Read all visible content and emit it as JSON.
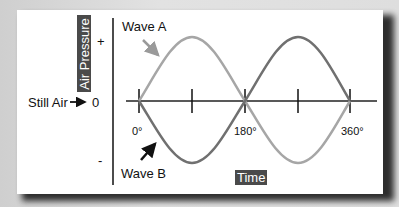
{
  "diagram": {
    "y_axis": {
      "title": "Air Pressure",
      "plus_label": "+",
      "zero_label": "0",
      "minus_label": "-",
      "still_air_label": "Still Air"
    },
    "x_axis": {
      "title": "Time",
      "tick_labels": [
        "0°",
        "180°",
        "360°"
      ],
      "ticks_degrees": [
        0,
        90,
        180,
        270,
        360
      ]
    },
    "waves": [
      {
        "name": "Wave A",
        "label": "Wave A",
        "phase": "starts positive",
        "color": "#a6a6a6"
      },
      {
        "name": "Wave B",
        "label": "Wave B",
        "phase": "starts negative (180° out of phase)",
        "color": "#6e6e6e"
      }
    ],
    "colors": {
      "background": "#d9d9d9",
      "card": "#ffffff",
      "axis": "#111111",
      "label_box": "#4a4a4a",
      "wave_a": "#a6a6a6",
      "wave_b": "#6e6e6e",
      "arrow_a": "#9a9a9a",
      "arrow_b": "#111111"
    }
  }
}
